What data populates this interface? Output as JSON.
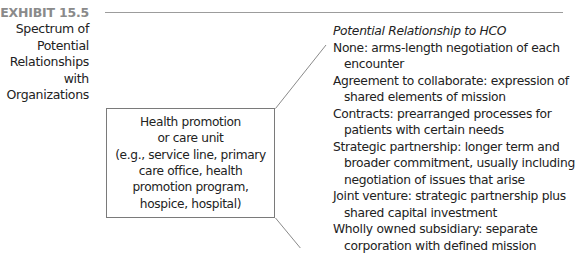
{
  "exhibit": {
    "number": "EXHIBIT 15.5",
    "title_lines": [
      "Spectrum of",
      "Potential",
      "Relationships",
      "with",
      "Organizations"
    ]
  },
  "unit_box": {
    "lines": [
      "Health promotion",
      "or care unit",
      "(e.g., service line, primary",
      "care office, health",
      "promotion program,",
      "hospice, hospital)"
    ]
  },
  "relationships": {
    "heading": "Potential Relationship to HCO",
    "items": [
      {
        "lines": [
          "None: arms-length negotiation of each",
          "encounter"
        ]
      },
      {
        "lines": [
          "Agreement to collaborate: expression of",
          "shared elements of mission"
        ]
      },
      {
        "lines": [
          "Contracts: prearranged processes for",
          "patients with certain needs"
        ]
      },
      {
        "lines": [
          "Strategic partnership: longer term and",
          "broader commitment, usually including",
          "negotiation of issues that arise"
        ]
      },
      {
        "lines": [
          "Joint venture: strategic partnership plus",
          "shared capital investment"
        ]
      },
      {
        "lines": [
          "Wholly owned subsidiary: separate",
          "corporation with defined mission"
        ]
      }
    ]
  },
  "colors": {
    "exhibit_label": "#8a8a8a",
    "rule": "#9c9c9c",
    "box_border": "#7a7a7a",
    "text": "#222222"
  }
}
